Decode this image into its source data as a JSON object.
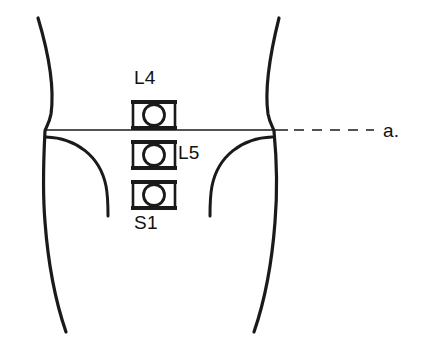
{
  "figure": {
    "background_color": "#ffffff",
    "stroke_color": "#1a1a1a",
    "dimensions": {
      "width": 427,
      "height": 349
    }
  },
  "labels": {
    "l4": "L4",
    "l5": "L5",
    "s1": "S1",
    "reference_line": "a."
  },
  "vertebrae": [
    {
      "id": "l4",
      "label": "L4",
      "center_y": 115
    },
    {
      "id": "l5",
      "label": "L5",
      "center_y": 155
    },
    {
      "id": "s1",
      "label": "S1",
      "center_y": 195
    }
  ],
  "reference_line": {
    "label": "a.",
    "solid_from_x": 45,
    "solid_to_x": 288,
    "dashed_from_x": 296,
    "dashed_to_x": 372,
    "y": 130,
    "dash_count": 5
  },
  "outlines": {
    "left_torso": "waist contour, left side",
    "right_torso": "waist contour, right side",
    "left_iliac_crest": "iliac crest arc, left",
    "right_iliac_crest": "iliac crest arc, right"
  }
}
